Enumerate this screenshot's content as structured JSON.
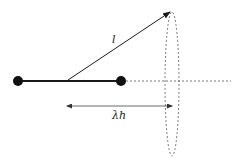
{
  "diagram": {
    "labels": {
      "vector_length": "l",
      "distance": "λh"
    },
    "colors": {
      "stroke": "#1a1a1a",
      "dashed": "#555555",
      "arrow_thin": "#444444",
      "background": "#ffffff"
    },
    "elements": {
      "left_node": {
        "cx": 18,
        "cy": 81,
        "r": 5
      },
      "right_node": {
        "cx": 121,
        "cy": 81,
        "r": 5
      },
      "rod": {
        "x1": 18,
        "y1": 81,
        "x2": 121,
        "y2": 81
      },
      "vector": {
        "x1": 68,
        "y1": 80,
        "x2": 170,
        "y2": 12
      },
      "axis_dashed": {
        "x1": 126,
        "y1": 81,
        "x2": 231,
        "y2": 81
      },
      "ellipse_dashed": {
        "cx": 172,
        "cy": 84,
        "rx": 7,
        "ry": 72
      },
      "distance_arrow": {
        "x1": 67,
        "y1": 106,
        "x2": 172,
        "y2": 106
      }
    }
  }
}
